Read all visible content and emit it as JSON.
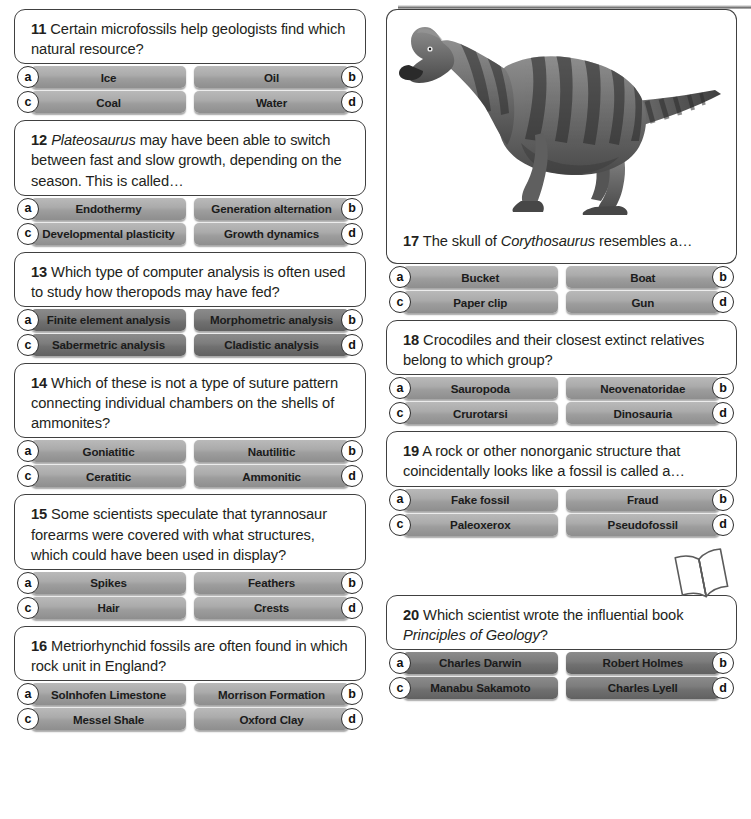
{
  "page": {
    "decorations": {
      "top_rule": "horizontal-rule",
      "book_icon": "open-book-icon",
      "dino_image": "corythosaurus-illustration"
    }
  },
  "left_column": [
    {
      "number": "11",
      "text": "Certain microfossils help geologists find which natural resource?",
      "italic_lead": "",
      "style": "light",
      "answers": [
        {
          "letter": "a",
          "label": "Ice"
        },
        {
          "letter": "b",
          "label": "Oil"
        },
        {
          "letter": "c",
          "label": "Coal"
        },
        {
          "letter": "d",
          "label": "Water"
        }
      ]
    },
    {
      "number": "12",
      "italic_lead": "Plateosaurus",
      "text": " may have been able to switch between fast and slow growth, depending on the season. This is called…",
      "style": "light",
      "answers": [
        {
          "letter": "a",
          "label": "Endothermy"
        },
        {
          "letter": "b",
          "label": "Generation alternation"
        },
        {
          "letter": "c",
          "label": "Developmental plasticity"
        },
        {
          "letter": "d",
          "label": "Growth dynamics"
        }
      ]
    },
    {
      "number": "13",
      "italic_lead": "",
      "text": "Which type of computer analysis is often used to study how theropods may have fed?",
      "style": "dark",
      "answers": [
        {
          "letter": "a",
          "label": "Finite element analysis"
        },
        {
          "letter": "b",
          "label": "Morphometric analysis"
        },
        {
          "letter": "c",
          "label": "Sabermetric analysis"
        },
        {
          "letter": "d",
          "label": "Cladistic analysis"
        }
      ]
    },
    {
      "number": "14",
      "italic_lead": "",
      "text": "Which of these is not a type of suture pattern connecting individual chambers on the shells of ammonites?",
      "style": "light",
      "answers": [
        {
          "letter": "a",
          "label": "Goniatitic"
        },
        {
          "letter": "b",
          "label": "Nautilitic"
        },
        {
          "letter": "c",
          "label": "Ceratitic"
        },
        {
          "letter": "d",
          "label": "Ammonitic"
        }
      ]
    },
    {
      "number": "15",
      "italic_lead": "",
      "text": "Some scientists speculate that tyrannosaur forearms were covered with what structures, which could have been used in display?",
      "style": "light",
      "answers": [
        {
          "letter": "a",
          "label": "Spikes"
        },
        {
          "letter": "b",
          "label": "Feathers"
        },
        {
          "letter": "c",
          "label": "Hair"
        },
        {
          "letter": "d",
          "label": "Crests"
        }
      ]
    },
    {
      "number": "16",
      "italic_lead": "",
      "text": "Metriorhynchid fossils are often found in which rock unit in England?",
      "style": "light",
      "answers": [
        {
          "letter": "a",
          "label": "Solnhofen Limestone"
        },
        {
          "letter": "b",
          "label": "Morrison Formation"
        },
        {
          "letter": "c",
          "label": "Messel Shale"
        },
        {
          "letter": "d",
          "label": "Oxford Clay"
        }
      ]
    }
  ],
  "right_column": [
    {
      "number": "17",
      "has_image": true,
      "image_name": "corythosaurus-illustration",
      "text_prefix": "The skull of ",
      "italic_mid": "Corythosaurus",
      "text_suffix": " resembles a…",
      "style": "light",
      "answers": [
        {
          "letter": "a",
          "label": "Bucket"
        },
        {
          "letter": "b",
          "label": "Boat"
        },
        {
          "letter": "c",
          "label": "Paper clip"
        },
        {
          "letter": "d",
          "label": "Gun"
        }
      ]
    },
    {
      "number": "18",
      "italic_lead": "",
      "text": "Crocodiles and their closest extinct relatives belong to which group?",
      "style": "light",
      "answers": [
        {
          "letter": "a",
          "label": "Sauropoda"
        },
        {
          "letter": "b",
          "label": "Neovenatoridae"
        },
        {
          "letter": "c",
          "label": "Crurotarsi"
        },
        {
          "letter": "d",
          "label": "Dinosauria"
        }
      ]
    },
    {
      "number": "19",
      "italic_lead": "",
      "text": "A rock or other nonorganic structure that coincidentally looks like a fossil is called a…",
      "style": "light",
      "answers": [
        {
          "letter": "a",
          "label": "Fake fossil"
        },
        {
          "letter": "b",
          "label": "Fraud"
        },
        {
          "letter": "c",
          "label": "Paleoxerox"
        },
        {
          "letter": "d",
          "label": "Pseudofossil"
        }
      ]
    },
    {
      "number": "20",
      "text_prefix": "Which scientist wrote the influential book ",
      "italic_mid": "Principles of Geology",
      "text_suffix": "?",
      "style": "dark",
      "answers": [
        {
          "letter": "a",
          "label": "Charles Darwin"
        },
        {
          "letter": "b",
          "label": "Robert Holmes"
        },
        {
          "letter": "c",
          "label": "Manabu Sakamoto"
        },
        {
          "letter": "d",
          "label": "Charles Lyell"
        }
      ]
    }
  ]
}
